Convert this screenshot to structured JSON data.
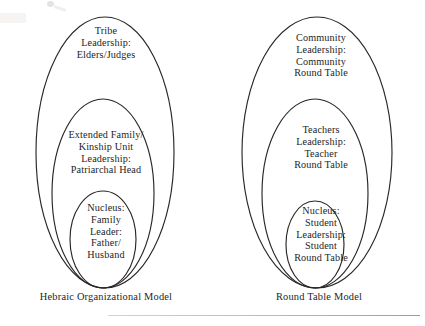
{
  "figure": {
    "kind": "nested-ellipse-organizational-diagram",
    "ink_color": "#2b2626",
    "background_color": "#ffffff"
  },
  "models": [
    {
      "id": "hebraic",
      "caption": "Hebraic Organizational Model",
      "rings": [
        {
          "id": "hebraic-outer",
          "level": "outer",
          "lines": [
            "Tribe",
            "Leadership:",
            "Elders/Judges"
          ]
        },
        {
          "id": "hebraic-middle",
          "level": "middle",
          "lines": [
            "Extended Family/",
            "Kinship Unit",
            "Leadership:",
            "Patriarchal Head"
          ]
        },
        {
          "id": "hebraic-inner",
          "level": "inner",
          "lines": [
            "Nucleus:",
            "Family",
            "Leader:",
            "Father/",
            "Husband"
          ]
        }
      ]
    },
    {
      "id": "roundtable",
      "caption": "Round Table Model",
      "rings": [
        {
          "id": "roundtable-outer",
          "level": "outer",
          "lines": [
            "Community",
            "Leadership:",
            "Community",
            "Round Table"
          ]
        },
        {
          "id": "roundtable-middle",
          "level": "middle",
          "lines": [
            "Teachers",
            "Leadership:",
            "Teacher",
            "Round Table"
          ]
        },
        {
          "id": "roundtable-inner",
          "level": "inner",
          "lines": [
            "Nucleus:",
            "Student",
            "Leadership:",
            "Student",
            "Round Table"
          ]
        }
      ]
    }
  ]
}
